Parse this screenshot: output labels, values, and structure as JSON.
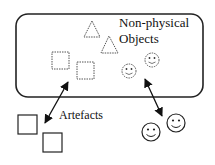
{
  "diagram": {
    "group_label_line1": "Non-physical",
    "group_label_line2": "Objects",
    "artefacts_label": "Artefacts",
    "nodes": {
      "non_physical": {
        "triangles": 2,
        "dashed_squares": 2,
        "dashed_smileys": 2
      },
      "physical": {
        "squares": 2,
        "smileys": 2
      }
    },
    "connectors": [
      {
        "from": "dashed-squares",
        "to": "artefact-squares",
        "type": "double-arrow"
      },
      {
        "from": "dashed-smileys",
        "to": "physical-smileys",
        "type": "double-arrow"
      }
    ],
    "colors": {
      "stroke": "#222222",
      "dashed_stroke": "#555555",
      "background": "#ffffff"
    }
  }
}
